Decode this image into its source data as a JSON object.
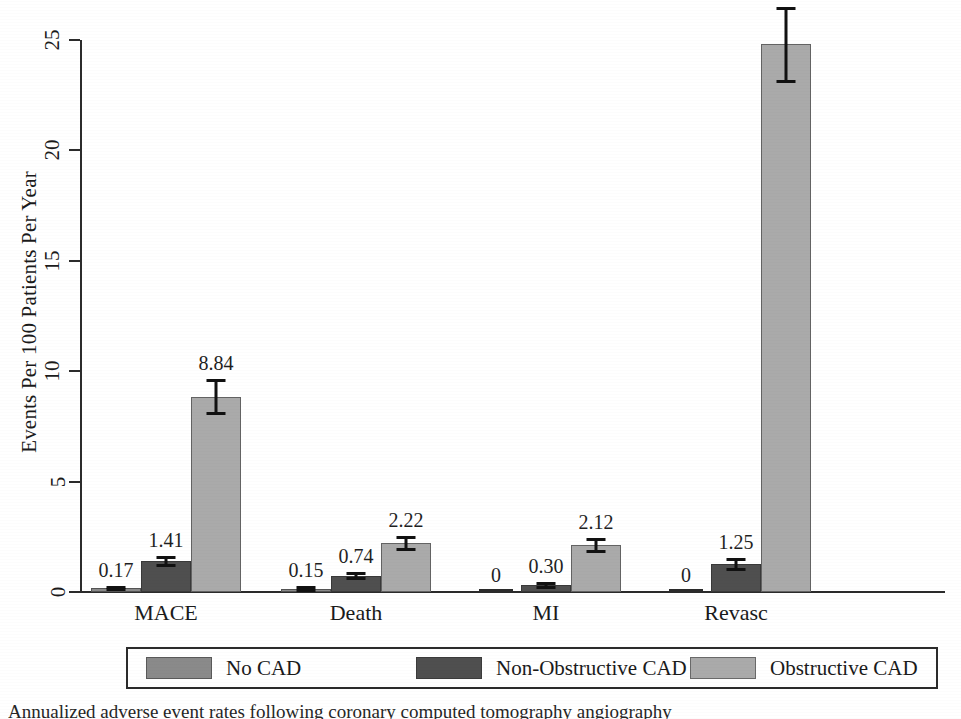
{
  "chart_data": {
    "type": "bar",
    "title": "",
    "subtitle": "",
    "xlabel": "",
    "ylabel": "Events Per 100 Patients Per Year",
    "categories": [
      "MACE",
      "Death",
      "MI",
      "Revasc"
    ],
    "ylim": [
      0,
      25
    ],
    "yticks": [
      0,
      5,
      10,
      15,
      20,
      25
    ],
    "ytick_labels": [
      "0",
      "5",
      "10",
      "15",
      "20",
      "25"
    ],
    "grid": false,
    "legend_position": "bottom",
    "series": [
      {
        "name": "No CAD",
        "color": "#8a8a8a",
        "values": [
          0.17,
          0.15,
          0,
          0
        ],
        "value_labels": [
          "0.17",
          "0.15",
          "0",
          "0"
        ],
        "errors_low": [
          0.12,
          0.1,
          null,
          null
        ],
        "errors_high": [
          0.24,
          0.22,
          null,
          null
        ]
      },
      {
        "name": "Non-Obstructive CAD",
        "color": "#4f4f4f",
        "values": [
          1.41,
          0.74,
          0.3,
          1.25
        ],
        "value_labels": [
          "1.41",
          "0.74",
          "0.30",
          "1.25"
        ],
        "errors_low": [
          1.23,
          0.62,
          0.22,
          1.02
        ],
        "errors_high": [
          1.6,
          0.88,
          0.4,
          1.5
        ]
      },
      {
        "name": "Obstructive CAD",
        "color": "#aaaaaa",
        "values": [
          8.84,
          2.22,
          2.12,
          24.82
        ],
        "value_labels": [
          "8.84",
          "2.22",
          "2.12",
          "24.82"
        ],
        "errors_low": [
          8.1,
          1.95,
          1.85,
          23.15
        ],
        "errors_high": [
          9.58,
          2.5,
          2.4,
          26.45
        ]
      }
    ]
  },
  "legend": {
    "entries": [
      {
        "label": "No CAD",
        "color": "#8a8a8a"
      },
      {
        "label": "Non-Obstructive CAD",
        "color": "#4f4f4f"
      },
      {
        "label": "Obstructive CAD",
        "color": "#aaaaaa"
      }
    ]
  },
  "caption": {
    "text": "Annualized adverse event rates following coronary computed tomography angiography"
  }
}
